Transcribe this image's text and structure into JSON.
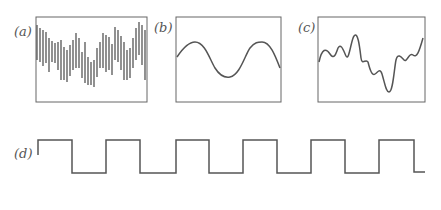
{
  "panels": [
    {
      "id": "a",
      "label": "(a)",
      "description": "noisy signal sampled with dense vertical bars"
    },
    {
      "id": "b",
      "label": "(b)",
      "description": "smooth sine wave, about 1.5 cycles"
    },
    {
      "id": "c",
      "label": "(c)",
      "description": "irregular wavy signal"
    },
    {
      "id": "d",
      "label": "(d)",
      "description": "square wave, 6 periods"
    }
  ],
  "colors": {
    "stroke": "#555555",
    "background": "#ffffff"
  }
}
